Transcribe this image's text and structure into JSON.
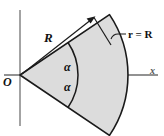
{
  "figure": {
    "labels": {
      "radius": "R",
      "origin": "O",
      "x_axis": "x",
      "arc_equation": "r = R",
      "angle_upper": "α",
      "angle_lower": "α"
    },
    "colors": {
      "sector_fill": "#dcdcdc",
      "sector_stroke": "#1a1a1a",
      "axis": "#8c8c8c",
      "label": "#111111",
      "background": "#ffffff"
    },
    "geometry": {
      "origin_px": [
        20,
        75
      ],
      "radius_px": 108,
      "half_angle_deg": 34,
      "axis_x_extent_px": [
        4,
        158
      ],
      "axis_y_extent_px": [
        10,
        126
      ]
    }
  }
}
